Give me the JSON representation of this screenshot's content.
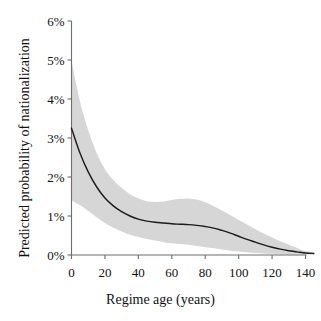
{
  "chart_data": {
    "type": "line",
    "title": "",
    "xlabel": "Regime age (years)",
    "ylabel": "Predicted probability of nationalization",
    "xlim": [
      -2,
      146
    ],
    "ylim": [
      0,
      6
    ],
    "grid": false,
    "legend": null,
    "xticks": [
      0,
      20,
      40,
      60,
      80,
      100,
      120,
      140
    ],
    "xticklabels": [
      "0",
      "20",
      "40",
      "60",
      "80",
      "100",
      "120",
      "140"
    ],
    "yticks": [
      0,
      1,
      2,
      3,
      4,
      5,
      6
    ],
    "yticklabels": [
      "0%",
      "1%",
      "2%",
      "3%",
      "4%",
      "5%",
      "6%"
    ],
    "series": [
      {
        "name": "Predicted probability",
        "style": "solid-line",
        "color": "#1a1a1a",
        "x": [
          0,
          5,
          10,
          15,
          20,
          25,
          30,
          35,
          40,
          45,
          50,
          55,
          60,
          65,
          70,
          75,
          80,
          85,
          90,
          95,
          100,
          105,
          110,
          115,
          120,
          125,
          130,
          135,
          140,
          145
        ],
        "values": [
          3.25,
          2.62,
          2.13,
          1.75,
          1.46,
          1.26,
          1.11,
          1.0,
          0.92,
          0.87,
          0.84,
          0.82,
          0.8,
          0.79,
          0.78,
          0.76,
          0.73,
          0.69,
          0.63,
          0.56,
          0.48,
          0.4,
          0.33,
          0.26,
          0.2,
          0.15,
          0.11,
          0.08,
          0.05,
          0.04
        ]
      },
      {
        "name": "95% confidence band upper",
        "style": "shaded-band",
        "color": "#d6d6d6",
        "x": [
          0,
          5,
          10,
          15,
          20,
          25,
          30,
          35,
          40,
          45,
          50,
          55,
          60,
          65,
          70,
          75,
          80,
          85,
          90,
          95,
          100,
          105,
          110,
          115,
          120,
          125,
          130,
          135,
          140,
          145
        ],
        "values": [
          5.0,
          3.95,
          3.2,
          2.62,
          2.2,
          1.92,
          1.72,
          1.56,
          1.45,
          1.38,
          1.36,
          1.37,
          1.41,
          1.44,
          1.45,
          1.42,
          1.35,
          1.25,
          1.14,
          1.02,
          0.9,
          0.78,
          0.66,
          0.55,
          0.45,
          0.35,
          0.26,
          0.18,
          0.1,
          0.06
        ]
      },
      {
        "name": "95% confidence band lower",
        "style": "shaded-band",
        "color": "#d6d6d6",
        "x": [
          0,
          5,
          10,
          15,
          20,
          25,
          30,
          35,
          40,
          45,
          50,
          55,
          60,
          65,
          70,
          75,
          80,
          85,
          90,
          95,
          100,
          105,
          110,
          115,
          120,
          125,
          130,
          135,
          140,
          145
        ],
        "values": [
          1.4,
          1.28,
          1.13,
          0.97,
          0.82,
          0.7,
          0.6,
          0.52,
          0.46,
          0.41,
          0.37,
          0.33,
          0.3,
          0.28,
          0.26,
          0.23,
          0.2,
          0.17,
          0.14,
          0.11,
          0.09,
          0.07,
          0.05,
          0.04,
          0.03,
          0.02,
          0.015,
          0.012,
          0.01,
          0.01
        ]
      }
    ]
  },
  "axes": {
    "x_title": "Regime age (years)",
    "y_title": "Predicted probability of nationalization",
    "y_labels": [
      "6%",
      "5%",
      "4%",
      "3%",
      "2%",
      "1%",
      "0%"
    ],
    "x_labels": [
      "0",
      "20",
      "40",
      "60",
      "80",
      "100",
      "120",
      "140"
    ]
  },
  "colors": {
    "band": "#d6d6d6",
    "line": "#1a1a1a",
    "axis": "#6e6e6e",
    "text": "#111111",
    "background": "#ffffff"
  }
}
